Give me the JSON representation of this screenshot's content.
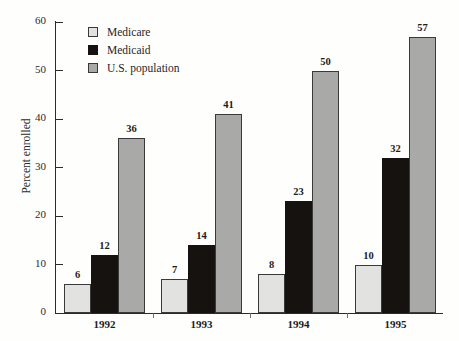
{
  "chart_data": {
    "type": "bar",
    "title": "",
    "xlabel": "",
    "ylabel": "Percent enrolled",
    "ylim": [
      0,
      60
    ],
    "ytick_step": 10,
    "yticks": [
      0,
      10,
      20,
      30,
      40,
      50,
      60
    ],
    "grid": false,
    "legend_position": "top-left-inside",
    "categories": [
      "1992",
      "1993",
      "1994",
      "1995"
    ],
    "series": [
      {
        "name": "Medicare",
        "color": "#e2e2e0",
        "values": [
          6,
          7,
          8,
          10
        ],
        "labels": [
          "6",
          "7",
          "8",
          "10"
        ]
      },
      {
        "name": "Medicaid",
        "color": "#151210",
        "values": [
          12,
          14,
          23,
          32
        ],
        "labels": [
          "12",
          "14",
          "23",
          "32"
        ]
      },
      {
        "name": "U.S. population",
        "color": "#a9a9a7",
        "values": [
          36,
          41,
          50,
          57
        ],
        "labels": [
          "36",
          "41",
          "50",
          "57"
        ]
      }
    ]
  },
  "axis": {
    "y_label": "Percent enrolled",
    "y_ticks": [
      "0",
      "10",
      "20",
      "30",
      "40",
      "50",
      "60"
    ],
    "x_ticks": [
      "1992",
      "1993",
      "1994",
      "1995"
    ]
  },
  "legend": {
    "items": [
      {
        "label": "Medicare",
        "swatch": "medicare"
      },
      {
        "label": "Medicaid",
        "swatch": "medicaid"
      },
      {
        "label": "U.S. population",
        "swatch": "population"
      }
    ]
  }
}
